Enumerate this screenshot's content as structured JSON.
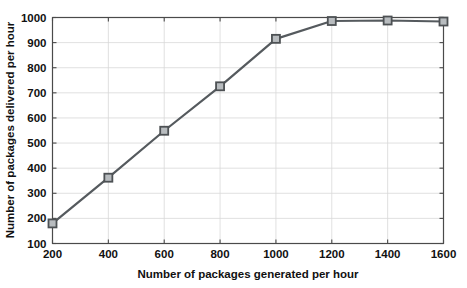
{
  "chart_data": {
    "type": "line",
    "title": "",
    "subtitle": "",
    "xlabel": "Number of packages generated per hour",
    "ylabel": "Number of packages delivered per hour",
    "x": [
      200,
      400,
      600,
      800,
      1000,
      1200,
      1400,
      1600
    ],
    "values": [
      180,
      362,
      549,
      726,
      915,
      986,
      988,
      984
    ],
    "series": [
      {
        "name": "packages delivered",
        "x": [
          200,
          400,
          600,
          800,
          1000,
          1200,
          1400,
          1600
        ],
        "values": [
          180,
          362,
          549,
          726,
          915,
          986,
          988,
          984
        ]
      }
    ],
    "xlim": [
      200,
      1600
    ],
    "ylim": [
      100,
      1000
    ],
    "xticks": [
      200,
      400,
      600,
      800,
      1000,
      1200,
      1400,
      1600
    ],
    "yticks": [
      100,
      200,
      300,
      400,
      500,
      600,
      700,
      800,
      900,
      1000
    ],
    "xticklabels": [
      "200",
      "400",
      "600",
      "800",
      "1000",
      "1200",
      "1400",
      "1600"
    ],
    "yticklabels": [
      "100",
      "200",
      "300",
      "400",
      "500",
      "600",
      "700",
      "800",
      "900",
      "1000"
    ],
    "grid": true,
    "legend": false,
    "legend_position": "none",
    "marker": "square",
    "colors": {
      "line": "#555a5e",
      "marker_face": "#b8bcbf",
      "marker_edge": "#4d5154",
      "grid": "#d8d8d8",
      "axis": "#4a4a4a",
      "text": "#111111",
      "background": "#ffffff"
    },
    "annotations": []
  }
}
